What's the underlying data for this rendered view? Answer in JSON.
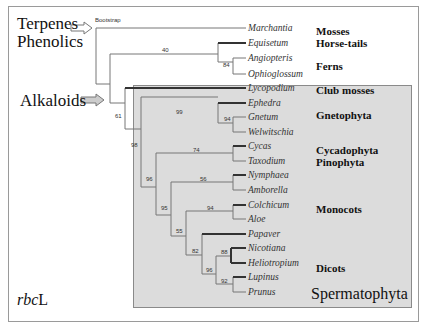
{
  "figure": {
    "marker_label": "rbcL",
    "marker_label_italic": "rbc",
    "marker_label_plain": "L",
    "bootstrap_header": "Bootstrap",
    "compound_classes": [
      {
        "label": "Terpenes",
        "arrow_target": "root"
      },
      {
        "label": "Phenolics",
        "arrow_target": "root"
      },
      {
        "label": "Alkaloids",
        "arrow_target": "vascular-clade"
      }
    ],
    "shaded_clade_label": "Spermatophyta",
    "taxa": [
      {
        "name": "Marchantia"
      },
      {
        "name": "Equisetum"
      },
      {
        "name": "Angiopteris"
      },
      {
        "name": "Ophioglossum"
      },
      {
        "name": "Lycopodium"
      },
      {
        "name": "Ephedra"
      },
      {
        "name": "Gnetum"
      },
      {
        "name": "Welwitschia"
      },
      {
        "name": "Cycas"
      },
      {
        "name": "Taxodium"
      },
      {
        "name": "Nymphaea"
      },
      {
        "name": "Amborella"
      },
      {
        "name": "Colchicum"
      },
      {
        "name": "Aloe"
      },
      {
        "name": "Papaver"
      },
      {
        "name": "Nicotiana"
      },
      {
        "name": "Heliotropium"
      },
      {
        "name": "Lupinus"
      },
      {
        "name": "Prunus"
      }
    ],
    "groups": [
      {
        "label": "Mosses"
      },
      {
        "label": "Horse-tails"
      },
      {
        "label": "Ferns"
      },
      {
        "label": "Club mosses"
      },
      {
        "label": "Gnetophyta"
      },
      {
        "label": "Cycadophyta"
      },
      {
        "label": "Pinophyta"
      },
      {
        "label": "Monocots"
      },
      {
        "label": "Dicots"
      }
    ],
    "bootstrap_values": {
      "ferns_horsetails": "40",
      "ferns": "84",
      "vascular": "61",
      "seed_plants": "98",
      "gnetophyta": "99",
      "gnetum_welwitschia": "94",
      "cycas_taxodium": "74",
      "gymno_angio": "96",
      "angiosperms": "95",
      "nymphaea_amborella": "56",
      "monocots": "94",
      "core_angio": "55",
      "dicots": "82",
      "nicotiana_heliotropium": "88",
      "dicots_inner": "96",
      "lupinus_prunus": "92"
    }
  }
}
